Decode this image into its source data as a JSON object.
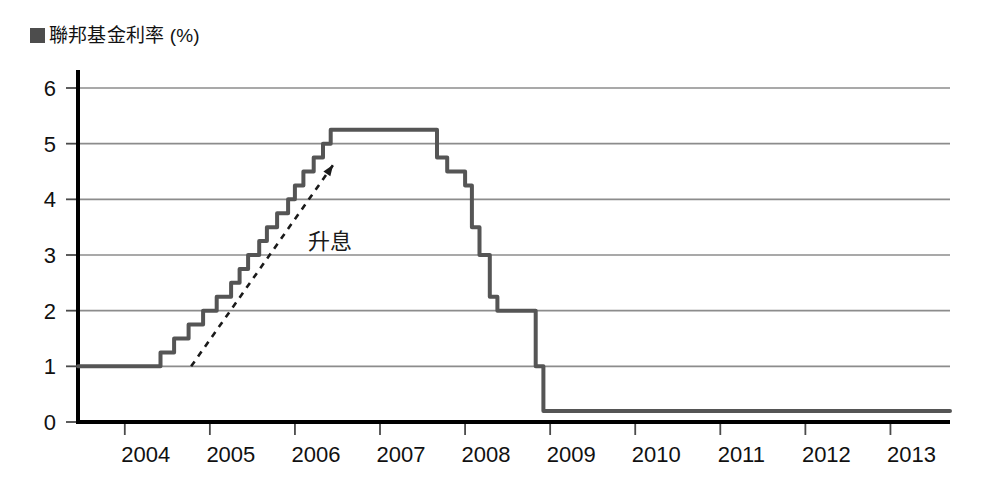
{
  "legend": {
    "marker_name": "series-color-swatch",
    "marker_color": "#4d4d4d",
    "label": "■聯邦基金利率 (%)",
    "label_text": "聯邦基金利率 (%)"
  },
  "annotation": {
    "label": "升息",
    "arrow_name": "rising-trend-arrow"
  },
  "axis": {
    "y_ticks": [
      "0",
      "1",
      "2",
      "3",
      "4",
      "5",
      "6"
    ],
    "x_ticks": [
      "2004",
      "2005",
      "2006",
      "2007",
      "2008",
      "2009",
      "2010",
      "2011",
      "2012",
      "2013"
    ]
  },
  "chart_data": {
    "type": "line",
    "title": "",
    "subtitle": "",
    "xlabel": "",
    "ylabel": "聯邦基金利率 (%)",
    "xlim": [
      2003.45,
      2013.7
    ],
    "ylim": [
      0,
      6
    ],
    "grid": true,
    "legend_position": "top-left",
    "yticks": [
      0,
      1,
      2,
      3,
      4,
      5,
      6
    ],
    "xticks": [
      2004,
      2005,
      2006,
      2007,
      2008,
      2009,
      2010,
      2011,
      2012,
      2013
    ],
    "annotations": [
      {
        "text": "升息",
        "x": 2006.15,
        "y": 3.1,
        "arrow_from": [
          2004.78,
          1.0
        ],
        "arrow_to": [
          2006.45,
          4.62
        ],
        "style": "dashed-arrow"
      }
    ],
    "series": [
      {
        "name": "聯邦基金利率 (%)",
        "color": "#555555",
        "step": true,
        "x": [
          2003.45,
          2004.33,
          2004.42,
          2004.58,
          2004.75,
          2004.84,
          2004.92,
          2005.08,
          2005.25,
          2005.35,
          2005.45,
          2005.58,
          2005.67,
          2005.79,
          2005.92,
          2006.0,
          2006.1,
          2006.22,
          2006.33,
          2006.42,
          2006.5,
          2007.58,
          2007.67,
          2007.79,
          2007.88,
          2008.0,
          2008.08,
          2008.17,
          2008.21,
          2008.29,
          2008.38,
          2008.5,
          2008.75,
          2008.83,
          2008.92,
          2013.7
        ],
        "y": [
          1.0,
          1.0,
          1.25,
          1.5,
          1.75,
          1.75,
          2.0,
          2.25,
          2.5,
          2.75,
          3.0,
          3.25,
          3.5,
          3.75,
          4.0,
          4.25,
          4.5,
          4.75,
          5.0,
          5.25,
          5.25,
          5.25,
          4.75,
          4.5,
          4.5,
          4.25,
          3.5,
          3.0,
          3.0,
          2.25,
          2.0,
          2.0,
          2.0,
          1.0,
          0.2,
          0.2
        ]
      }
    ]
  }
}
